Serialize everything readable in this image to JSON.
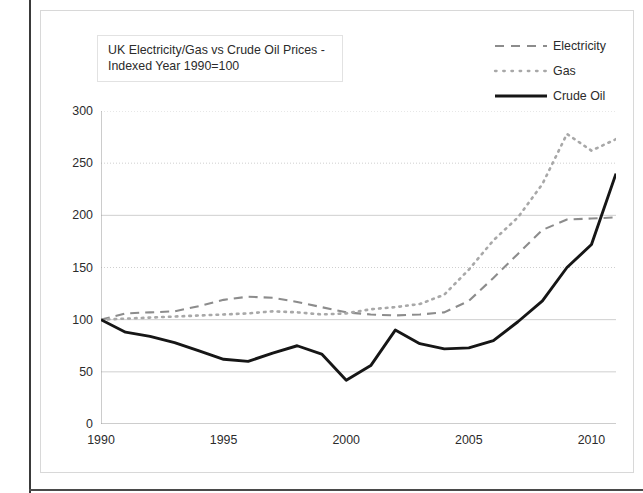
{
  "chart_data": {
    "type": "line",
    "title": "UK Electricity/Gas vs Crude Oil Prices - Indexed Year 1990=100",
    "title_lines": [
      "UK Electricity/Gas vs Crude Oil Prices -",
      "Indexed Year 1990=100"
    ],
    "xlabel": "",
    "ylabel": "",
    "xlim": [
      1990,
      2011
    ],
    "ylim": [
      0,
      300
    ],
    "ytick_step": 50,
    "xtick_step": 5,
    "grid": true,
    "legend_position": "top-right",
    "x": [
      1990,
      1991,
      1992,
      1993,
      1994,
      1995,
      1996,
      1997,
      1998,
      1999,
      2000,
      2001,
      2002,
      2003,
      2004,
      2005,
      2006,
      2007,
      2008,
      2009,
      2010,
      2011
    ],
    "ytick_labels": [
      "0",
      "50",
      "100",
      "150",
      "200",
      "250",
      "300"
    ],
    "xtick_labels": [
      "1990",
      "1995",
      "2000",
      "2005",
      "2010"
    ],
    "series": [
      {
        "name": "Electricity",
        "style": "dashed",
        "color": "#8c8c8c",
        "values": [
          100,
          106,
          107,
          108,
          113,
          119,
          122,
          121,
          117,
          112,
          107,
          105,
          104,
          105,
          107,
          118,
          140,
          163,
          186,
          196,
          197,
          198
        ]
      },
      {
        "name": "Gas",
        "style": "dotted",
        "color": "#a8a8a8",
        "values": [
          100,
          101,
          102,
          103,
          104,
          105,
          106,
          108,
          107,
          105,
          106,
          110,
          112,
          115,
          124,
          148,
          176,
          198,
          230,
          278,
          262,
          273
        ]
      },
      {
        "name": "Crude Oil",
        "style": "solid",
        "color": "#161616",
        "values": [
          100,
          88,
          84,
          78,
          70,
          62,
          60,
          68,
          75,
          67,
          42,
          56,
          90,
          77,
          72,
          73,
          80,
          98,
          118,
          150,
          172,
          240
        ]
      }
    ]
  },
  "legend": {
    "items": [
      {
        "label": "Electricity",
        "icon": "dashed-line-icon"
      },
      {
        "label": "Gas",
        "icon": "dotted-line-icon"
      },
      {
        "label": "Crude Oil",
        "icon": "solid-line-icon"
      }
    ]
  }
}
